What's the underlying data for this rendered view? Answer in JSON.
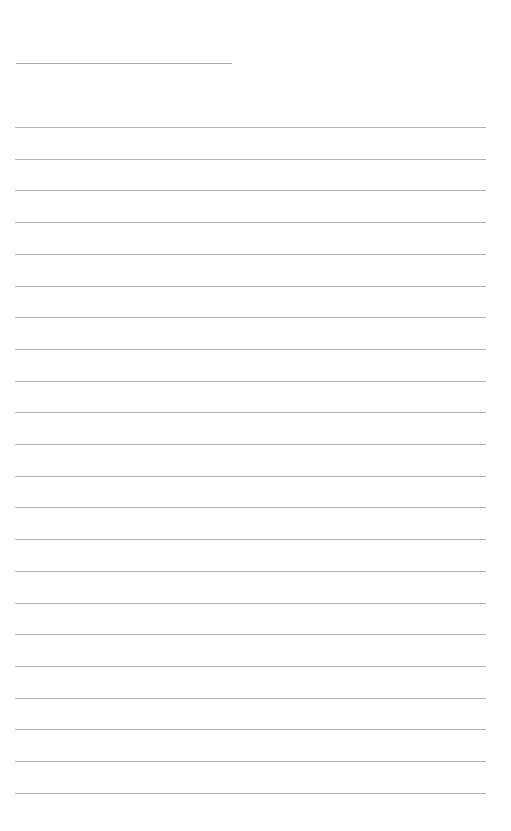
{
  "page": {
    "background": "#ffffff",
    "line_color": "#b0b0b0"
  },
  "title": {
    "text": ""
  },
  "lines": [
    {
      "text": ""
    },
    {
      "text": ""
    },
    {
      "text": ""
    },
    {
      "text": ""
    },
    {
      "text": ""
    },
    {
      "text": ""
    },
    {
      "text": ""
    },
    {
      "text": ""
    },
    {
      "text": ""
    },
    {
      "text": ""
    },
    {
      "text": ""
    },
    {
      "text": ""
    },
    {
      "text": ""
    },
    {
      "text": ""
    },
    {
      "text": ""
    },
    {
      "text": ""
    },
    {
      "text": ""
    },
    {
      "text": ""
    },
    {
      "text": ""
    },
    {
      "text": ""
    },
    {
      "text": ""
    },
    {
      "text": ""
    }
  ]
}
